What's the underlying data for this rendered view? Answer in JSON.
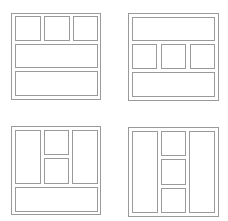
{
  "layouts": [
    {
      "name": "layout-three-top-two-rows",
      "frame": {
        "x": 11,
        "y": 13,
        "w": 90,
        "h": 87
      },
      "cells": [
        {
          "x": 15,
          "y": 16,
          "w": 26,
          "h": 25
        },
        {
          "x": 44,
          "y": 16,
          "w": 26,
          "h": 25
        },
        {
          "x": 73,
          "y": 16,
          "w": 25,
          "h": 25
        },
        {
          "x": 15,
          "y": 44,
          "w": 83,
          "h": 24
        },
        {
          "x": 15,
          "y": 71,
          "w": 83,
          "h": 25
        }
      ]
    },
    {
      "name": "layout-row-three-row",
      "frame": {
        "x": 128,
        "y": 13,
        "w": 91,
        "h": 88
      },
      "cells": [
        {
          "x": 132,
          "y": 17,
          "w": 83,
          "h": 24
        },
        {
          "x": 132,
          "y": 44,
          "w": 25,
          "h": 25
        },
        {
          "x": 161,
          "y": 44,
          "w": 25,
          "h": 25
        },
        {
          "x": 190,
          "y": 44,
          "w": 25,
          "h": 25
        },
        {
          "x": 132,
          "y": 72,
          "w": 83,
          "h": 25
        }
      ]
    },
    {
      "name": "layout-columns-stack-bottom-row",
      "frame": {
        "x": 11,
        "y": 126,
        "w": 90,
        "h": 89
      },
      "cells": [
        {
          "x": 15,
          "y": 130,
          "w": 26,
          "h": 54
        },
        {
          "x": 44,
          "y": 130,
          "w": 25,
          "h": 25
        },
        {
          "x": 44,
          "y": 158,
          "w": 25,
          "h": 26
        },
        {
          "x": 72,
          "y": 130,
          "w": 26,
          "h": 54
        },
        {
          "x": 15,
          "y": 187,
          "w": 83,
          "h": 25
        }
      ]
    },
    {
      "name": "layout-columns-triple-stack",
      "frame": {
        "x": 128,
        "y": 127,
        "w": 91,
        "h": 90
      },
      "cells": [
        {
          "x": 132,
          "y": 131,
          "w": 26,
          "h": 82
        },
        {
          "x": 161,
          "y": 131,
          "w": 25,
          "h": 25
        },
        {
          "x": 161,
          "y": 159,
          "w": 25,
          "h": 26
        },
        {
          "x": 161,
          "y": 188,
          "w": 25,
          "h": 25
        },
        {
          "x": 189,
          "y": 131,
          "w": 26,
          "h": 82
        }
      ]
    }
  ]
}
